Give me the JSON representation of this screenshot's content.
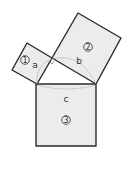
{
  "diagram": {
    "title": "",
    "squares": [
      {
        "id": "1",
        "label": "1",
        "side_label": "a"
      },
      {
        "id": "2",
        "label": "2",
        "side_label": "b"
      },
      {
        "id": "3",
        "label": "3",
        "side_label": "c"
      }
    ],
    "colors": {
      "fill": "#ececec",
      "stroke": "#2a2a2a",
      "arc": "#9a9a9a"
    }
  }
}
